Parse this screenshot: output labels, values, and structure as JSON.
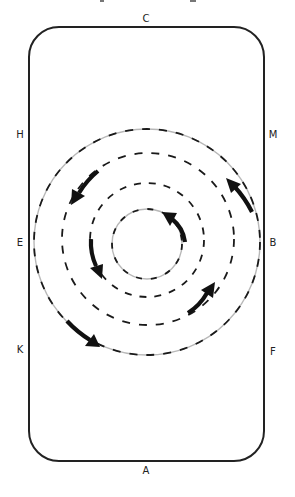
{
  "diagram": {
    "type": "dressage-arena-circles",
    "arena": {
      "shape": "rounded-rectangle",
      "stroke_color": "#222222"
    },
    "markers": {
      "top": "C",
      "bottom": "A",
      "left_upper": "H",
      "left_middle": "E",
      "left_lower": "K",
      "right_upper": "M",
      "right_middle": "B",
      "right_lower": "F"
    },
    "circles": [
      {
        "name": "outer",
        "style": "gray solid with black dashes"
      },
      {
        "name": "second",
        "style": "black dashed"
      },
      {
        "name": "third",
        "style": "black dashed"
      },
      {
        "name": "inner",
        "style": "gray solid with black dashes"
      }
    ],
    "arrows": [
      {
        "circle": "outer",
        "position": "upper-right",
        "direction": "counter-clockwise"
      },
      {
        "circle": "outer",
        "position": "lower-left",
        "direction": "counter-clockwise"
      },
      {
        "circle": "second",
        "position": "upper-left",
        "direction": "counter-clockwise"
      },
      {
        "circle": "third",
        "position": "left",
        "direction": "counter-clockwise"
      },
      {
        "circle": "third",
        "position": "lower-right",
        "direction": "counter-clockwise"
      },
      {
        "circle": "inner",
        "position": "upper-right",
        "direction": "counter-clockwise"
      }
    ],
    "colors": {
      "line": "#111111",
      "ring_gray": "#b8b8b8",
      "background": "#ffffff"
    }
  }
}
